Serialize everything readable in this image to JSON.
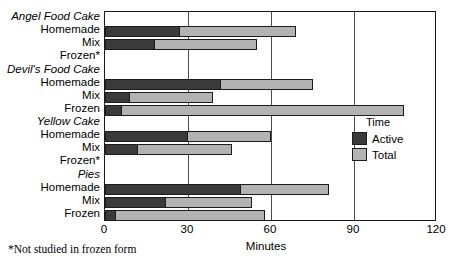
{
  "chart_data": {
    "type": "bar",
    "orientation": "horizontal",
    "title": "",
    "xlabel": "Minutes",
    "ylabel": "",
    "xlim": [
      0,
      120
    ],
    "xticks": [
      0,
      30,
      60,
      90,
      120
    ],
    "xtick_labels": [
      "0",
      "30",
      "60",
      "90",
      "120"
    ],
    "grid": true,
    "legend": {
      "title": "Time",
      "position": "inside-right",
      "entries": [
        {
          "name": "Active",
          "color": "#3a3a3a"
        },
        {
          "name": "Total",
          "color": "#b3b3b3"
        }
      ]
    },
    "series": [
      {
        "name": "Active",
        "color": "#3a3a3a"
      },
      {
        "name": "Total",
        "color": "#b3b3b3"
      }
    ],
    "groups": [
      {
        "label": "Angel Food Cake",
        "rows": [
          {
            "label": "Homemade",
            "active": 27,
            "total": 69,
            "no_data": false
          },
          {
            "label": "Mix",
            "active": 18,
            "total": 55,
            "no_data": false
          },
          {
            "label": "Frozen*",
            "active": null,
            "total": null,
            "no_data": true
          }
        ]
      },
      {
        "label": "Devil's Food Cake",
        "rows": [
          {
            "label": "Homemade",
            "active": 42,
            "total": 75,
            "no_data": false
          },
          {
            "label": "Mix",
            "active": 9,
            "total": 39,
            "no_data": false
          },
          {
            "label": "Frozen",
            "active": 6,
            "total": 108,
            "no_data": false
          }
        ]
      },
      {
        "label": "Yellow Cake",
        "rows": [
          {
            "label": "Homemade",
            "active": 30,
            "total": 60,
            "no_data": false
          },
          {
            "label": "Mix",
            "active": 12,
            "total": 46,
            "no_data": false
          },
          {
            "label": "Frozen*",
            "active": null,
            "total": null,
            "no_data": true
          }
        ]
      },
      {
        "label": "Pies",
        "rows": [
          {
            "label": "Homemade",
            "active": 49,
            "total": 81,
            "no_data": false
          },
          {
            "label": "Mix",
            "active": 22,
            "total": 53,
            "no_data": false
          },
          {
            "label": "Frozen",
            "active": 4,
            "total": 58,
            "no_data": false
          }
        ]
      }
    ],
    "footnote": "*Not studied in frozen form"
  },
  "colors": {
    "active": "#3a3a3a",
    "total": "#b3b3b3",
    "axis": "#1a1a1a",
    "grid": "#4d4d4d",
    "background": "#ffffff"
  }
}
